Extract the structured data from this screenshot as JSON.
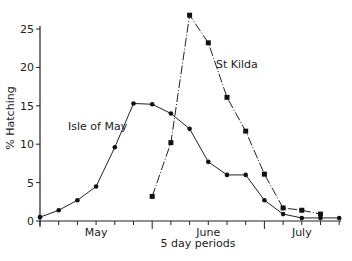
{
  "chart_data": {
    "type": "line",
    "title": "",
    "xlabel": "5 day periods",
    "ylabel": "% Hatching",
    "ylim": [
      0,
      25
    ],
    "yticks": [
      0,
      5,
      10,
      15,
      20,
      25
    ],
    "xlim": [
      0,
      16
    ],
    "month_labels": [
      {
        "label": "May",
        "x": 3
      },
      {
        "label": "June",
        "x": 9
      },
      {
        "label": "July",
        "x": 14
      }
    ],
    "month_boundaries": [
      6,
      12
    ],
    "grid": false,
    "legend": "inline labels",
    "series": [
      {
        "name": "Isle of May",
        "style": "solid",
        "marker": "circle",
        "x": [
          0,
          1,
          2,
          3,
          4,
          5,
          6,
          7,
          8,
          9,
          10,
          11,
          12,
          13,
          14,
          15,
          16
        ],
        "values": [
          0.5,
          1.4,
          2.7,
          4.5,
          9.6,
          15.3,
          15.2,
          14.0,
          12.0,
          7.7,
          6.0,
          6.0,
          2.7,
          0.9,
          0.4,
          0.4,
          0.4
        ]
      },
      {
        "name": "St Kilda",
        "style": "dash-dot",
        "marker": "square",
        "x": [
          6,
          7,
          8,
          9,
          10,
          11,
          12,
          13,
          14,
          15
        ],
        "values": [
          3.2,
          10.2,
          26.8,
          23.2,
          16.1,
          11.7,
          6.1,
          1.7,
          1.4,
          0.9
        ]
      }
    ]
  },
  "labels": {
    "ylabel": "% Hatching",
    "xlabel": "5 day periods",
    "series_isle": "Isle of May",
    "series_kilda": "St Kilda"
  }
}
